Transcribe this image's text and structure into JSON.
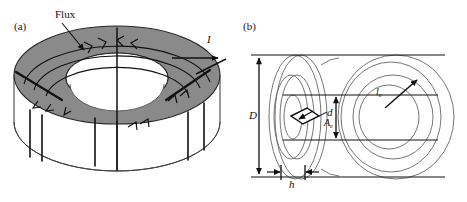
{
  "figure": {
    "width": 467,
    "height": 202,
    "background": "#ffffff",
    "ink_color": "#111111",
    "core_fill": "#8a8a8a"
  },
  "panels": [
    {
      "id": "a",
      "label": "(a)",
      "description": "Perspective view of toroidal core with windings",
      "annotations": [
        {
          "name": "flux",
          "text": "Flux",
          "italic": false
        },
        {
          "name": "current",
          "text": "I",
          "italic": true
        }
      ]
    },
    {
      "id": "b",
      "label": "(b)",
      "description": "Side view of toroid with dimensional annotations",
      "annotations": [
        {
          "name": "outer-diameter",
          "text": "D",
          "italic": true
        },
        {
          "name": "inner-diameter",
          "text": "d",
          "italic": true
        },
        {
          "name": "height",
          "text": "h",
          "italic": true
        },
        {
          "name": "effective-area",
          "text": "A",
          "subscript": "e",
          "italic": true
        },
        {
          "name": "effective-length",
          "text": "l",
          "subscript": "e",
          "italic": true
        }
      ]
    }
  ],
  "labels": {
    "panel_a": "(a)",
    "panel_b": "(b)",
    "flux": "Flux",
    "current": "I",
    "outer_diameter": "D",
    "inner_diameter": "d",
    "winding_height": "h",
    "effective_area_base": "A",
    "effective_area_sub": "e",
    "effective_length_base": "l",
    "effective_length_sub": "e"
  }
}
